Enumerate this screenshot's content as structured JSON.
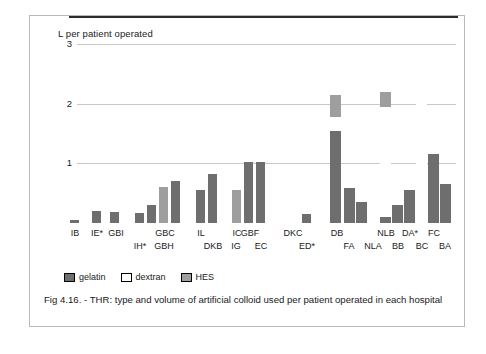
{
  "figure": {
    "caption": "Fig 4.16. - THR: type and volume of artificial colloid used per patient operated in each hospital"
  },
  "legend": {
    "position": "bottom-left",
    "items": [
      {
        "label": "gelatin",
        "color": "#6e6e6e"
      },
      {
        "label": "dextran",
        "color": "#ffffff"
      },
      {
        "label": "HES",
        "color": "#9e9e9e"
      }
    ]
  },
  "chart_data": {
    "type": "bar",
    "title": "",
    "subtitle": "",
    "xlabel": "",
    "ylabel": "L  per patient operated",
    "ylim": [
      0,
      3
    ],
    "yticks": [
      1,
      2,
      3
    ],
    "ytick_labels": [
      "1",
      "2",
      "3"
    ],
    "grid": true,
    "stacked": true,
    "colors": {
      "gelatin": "#6e6e6e",
      "dextran": "#ffffff",
      "HES": "#9e9e9e"
    },
    "series": [
      {
        "name": "gelatin"
      },
      {
        "name": "dextran"
      },
      {
        "name": "HES"
      }
    ],
    "categories": [
      "IB",
      "IE*",
      "GBI",
      "IH*",
      "GBH",
      "GBC",
      "IL",
      "DKB",
      "IG",
      "IC",
      "GBF",
      "EC",
      "DKC",
      "ED*",
      "DB",
      "FA",
      "NLA",
      "NLB",
      "BB",
      "DA*",
      "BC",
      "FC",
      "BA"
    ],
    "bars": [
      {
        "label": "IB",
        "gelatin": 0.05,
        "dextran": 0,
        "HES": 0,
        "total": 0.05
      },
      {
        "label": "IE*",
        "gelatin": 0.2,
        "dextran": 0,
        "HES": 0,
        "total": 0.2
      },
      {
        "label": "GBI",
        "gelatin": 0.19,
        "dextran": 0.12,
        "HES": 0,
        "total": 0.31
      },
      {
        "label": "IH*",
        "gelatin": 0.17,
        "dextran": 0,
        "HES": 0,
        "total": 0.17
      },
      {
        "label": "GBH",
        "gelatin": 0.3,
        "dextran": 0.26,
        "HES": 0,
        "total": 0.56
      },
      {
        "label": "GBC",
        "gelatin": 0,
        "dextran": 0,
        "HES": 0.6,
        "total": 0.6
      },
      {
        "label": "GBCb",
        "gelatin": 0.7,
        "dextran": 0,
        "HES": 0,
        "total": 0.7
      },
      {
        "label": "IL",
        "gelatin": 0.55,
        "dextran": 0,
        "HES": 0,
        "total": 0.55
      },
      {
        "label": "DKB",
        "gelatin": 0.82,
        "dextran": 0,
        "HES": 0,
        "total": 0.82
      },
      {
        "label": "IG",
        "gelatin": 0,
        "dextran": 0.52,
        "HES": 0,
        "total": 0.52
      },
      {
        "label": "IC",
        "gelatin": 0,
        "dextran": 0,
        "HES": 0.56,
        "total": 0.56
      },
      {
        "label": "GBF",
        "gelatin": 1.02,
        "dextran": 0,
        "HES": 0,
        "total": 1.02
      },
      {
        "label": "EC",
        "gelatin": 1.03,
        "dextran": 0,
        "HES": 0,
        "total": 1.03
      },
      {
        "label": "DKC",
        "gelatin": 0,
        "dextran": 0.8,
        "HES": 0,
        "total": 0.8
      },
      {
        "label": "ED*",
        "gelatin": 0.15,
        "dextran": 0,
        "HES": 0,
        "total": 0.15
      },
      {
        "label": "DB",
        "gelatin": 1.55,
        "dextran": 0.22,
        "HES": 0.38,
        "total": 2.15
      },
      {
        "label": "FA",
        "gelatin": 0.58,
        "dextran": 0,
        "HES": 0,
        "total": 0.58
      },
      {
        "label": "NLA",
        "gelatin": 0.35,
        "dextran": 0.5,
        "HES": 0,
        "total": 0.85
      },
      {
        "label": "NLB",
        "gelatin": 0.1,
        "dextran": 1.85,
        "HES": 0.25,
        "total": 2.2
      },
      {
        "label": "BB",
        "gelatin": 0.3,
        "dextran": 0,
        "HES": 0,
        "total": 0.3
      },
      {
        "label": "DA*",
        "gelatin": 0.55,
        "dextran": 0,
        "HES": 0,
        "total": 0.55
      },
      {
        "label": "BC",
        "gelatin": 0,
        "dextran": 2.55,
        "HES": 0,
        "total": 2.55
      },
      {
        "label": "FC",
        "gelatin": 1.15,
        "dextran": 0,
        "HES": 0,
        "total": 1.15
      },
      {
        "label": "BA",
        "gelatin": 0.65,
        "dextran": 0,
        "HES": 0,
        "total": 0.65
      }
    ],
    "xtick_rows": {
      "top": [
        "IB",
        "IE*",
        "GBI",
        "GBC",
        "IL",
        "IC",
        "GBF",
        "DKC",
        "DB",
        "NLB",
        "DA*",
        "FC"
      ],
      "bottom": [
        "IH*",
        "GBH",
        "DKB",
        "IG",
        "EC",
        "ED*",
        "FA",
        "NLA",
        "BB",
        "BC",
        "BA"
      ]
    }
  }
}
